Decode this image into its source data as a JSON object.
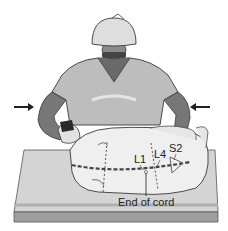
{
  "figure": {
    "labels": {
      "l1": "L1",
      "l4": "L4",
      "s2": "S2",
      "end_of_cord": "End of cord"
    },
    "arrows": [
      {
        "name": "left-arrow",
        "direction": "right"
      },
      {
        "name": "right-arrow",
        "direction": "left"
      }
    ],
    "colors": {
      "table_top": "#d6d6d6",
      "table_front": "#bdbdbd",
      "patient_body": "#eeeeee",
      "gown": "#bcbcbc",
      "arms": "#7a7a7a",
      "cap": "#dedede",
      "outline": "#3a3a3a",
      "spine_dash": "#444444"
    }
  }
}
